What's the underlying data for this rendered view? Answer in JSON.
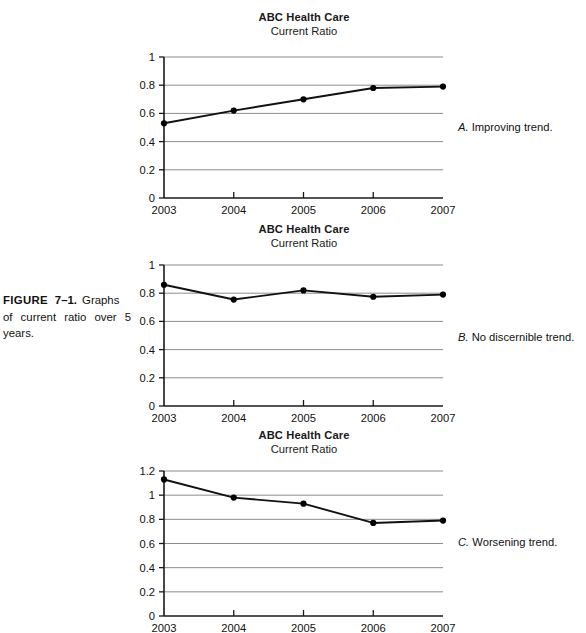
{
  "figure": {
    "label": "FIGURE",
    "number": "7–1.",
    "caption": "Graphs of current ratio over 5 years."
  },
  "notes": {
    "a_letter": "A.",
    "a_text": "Improving trend.",
    "b_letter": "B.",
    "b_text": "No discernible trend.",
    "c_letter": "C.",
    "c_text": "Worsening trend."
  },
  "colors": {
    "line": "#111111",
    "marker": "#000000",
    "grid": "#8c8c8c",
    "axis": "#1a1a1a",
    "text": "#111111",
    "background": "#ffffff"
  },
  "chart_data": [
    {
      "id": "chart-a",
      "type": "line",
      "title": "ABC Health Care",
      "subtitle": "Current Ratio",
      "xlabel": "",
      "ylabel": "",
      "categories": [
        "2003",
        "2004",
        "2005",
        "2006",
        "2007"
      ],
      "x": [
        2003,
        2004,
        2005,
        2006,
        2007
      ],
      "values": [
        0.53,
        0.62,
        0.7,
        0.78,
        0.79
      ],
      "ylim": [
        0,
        1
      ],
      "yticks": [
        "0",
        "0.2",
        "0.4",
        "0.6",
        "0.8",
        "1"
      ],
      "ytickvalues": [
        0,
        0.2,
        0.4,
        0.6,
        0.8,
        1
      ],
      "grid": true,
      "legend": "none",
      "markers": "filled-circle",
      "annotation": "A. Improving trend."
    },
    {
      "id": "chart-b",
      "type": "line",
      "title": "ABC Health Care",
      "subtitle": "Current Ratio",
      "xlabel": "",
      "ylabel": "",
      "categories": [
        "2003",
        "2004",
        "2005",
        "2006",
        "2007"
      ],
      "x": [
        2003,
        2004,
        2005,
        2006,
        2007
      ],
      "values": [
        0.86,
        0.755,
        0.82,
        0.775,
        0.79
      ],
      "ylim": [
        0,
        1
      ],
      "yticks": [
        "0",
        "0.2",
        "0.4",
        "0.6",
        "0.8",
        "1"
      ],
      "ytickvalues": [
        0,
        0.2,
        0.4,
        0.6,
        0.8,
        1
      ],
      "grid": true,
      "legend": "none",
      "markers": "filled-circle",
      "annotation": "B. No discernible trend."
    },
    {
      "id": "chart-c",
      "type": "line",
      "title": "ABC Health Care",
      "subtitle": "Current Ratio",
      "xlabel": "",
      "ylabel": "",
      "categories": [
        "2003",
        "2004",
        "2005",
        "2006",
        "2007"
      ],
      "x": [
        2003,
        2004,
        2005,
        2006,
        2007
      ],
      "values": [
        1.13,
        0.98,
        0.93,
        0.77,
        0.79
      ],
      "ylim": [
        0,
        1.2
      ],
      "yticks": [
        "0",
        "0.2",
        "0.4",
        "0.6",
        "0.8",
        "1",
        "1.2"
      ],
      "ytickvalues": [
        0,
        0.2,
        0.4,
        0.6,
        0.8,
        1,
        1.2
      ],
      "grid": true,
      "legend": "none",
      "markers": "filled-circle",
      "annotation": "C. Worsening trend."
    }
  ]
}
